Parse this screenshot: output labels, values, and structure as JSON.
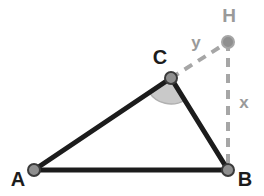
{
  "figure": {
    "background_color": "#ffffff",
    "width": 264,
    "height": 196
  },
  "colors": {
    "solid_stroke": "#1c1c1c",
    "dashed_stroke": "#a6a6a6",
    "vertex_fill": "#8f8f8f",
    "vertex_stroke": "#3a3a3a",
    "angle_fill": "#c9c9c9",
    "angle_stroke": "#b0b0b0",
    "label_dark": "#1c1c1c",
    "label_gray": "#9a9a9a"
  },
  "points": [
    {
      "id": "A",
      "label": "A",
      "x": 34,
      "y": 170,
      "label_x": 18,
      "label_y": 181,
      "label_color": "#1c1c1c",
      "style": "solid"
    },
    {
      "id": "B",
      "label": "B",
      "x": 228,
      "y": 170,
      "label_x": 245,
      "label_y": 181,
      "label_color": "#1c1c1c",
      "style": "solid"
    },
    {
      "id": "C",
      "label": "C",
      "x": 171,
      "y": 78,
      "label_x": 160,
      "label_y": 59,
      "label_color": "#1c1c1c",
      "style": "solid"
    },
    {
      "id": "H",
      "label": "H",
      "x": 228,
      "y": 42,
      "label_x": 229,
      "label_y": 17,
      "label_color": "#9a9a9a",
      "style": "dashed"
    }
  ],
  "segments": [
    {
      "id": "AC",
      "from": "A",
      "to": "C",
      "style": "solid",
      "label": "",
      "stroke": "#1c1c1c",
      "width": 5
    },
    {
      "id": "CB",
      "from": "C",
      "to": "B",
      "style": "solid",
      "label": "",
      "stroke": "#1c1c1c",
      "width": 5
    },
    {
      "id": "AB",
      "from": "A",
      "to": "B",
      "style": "solid",
      "label": "",
      "stroke": "#1c1c1c",
      "width": 5
    },
    {
      "id": "CH",
      "from": "C",
      "to": "H",
      "style": "dashed",
      "label": "y",
      "stroke": "#a6a6a6",
      "width": 4,
      "label_x": 196,
      "label_y": 44
    },
    {
      "id": "HB",
      "from": "H",
      "to": "B",
      "style": "dashed",
      "label": "x",
      "stroke": "#a6a6a6",
      "width": 4,
      "label_x": 244,
      "label_y": 104
    }
  ],
  "angle_marks": [
    {
      "id": "angle-ACB",
      "vertex": "C",
      "label": "",
      "radius": 26,
      "start_deg": 148,
      "end_deg": 58,
      "fill": "#c9c9c9",
      "stroke": "#b0b0b0"
    }
  ],
  "labels": {
    "A": "A",
    "B": "B",
    "C": "C",
    "H": "H",
    "x": "x",
    "y": "y"
  }
}
